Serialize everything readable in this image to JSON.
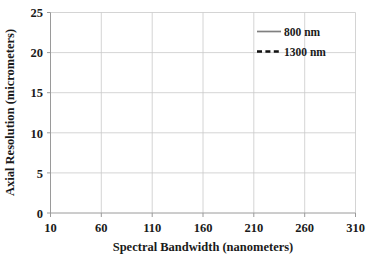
{
  "chart_data": {
    "type": "line",
    "title": "",
    "xlabel": "Spectral Bandwidth (nanometers)",
    "ylabel": "Axial Resolution (micrometers)",
    "xlim": [
      10,
      310
    ],
    "ylim": [
      0,
      25
    ],
    "xticks": [
      10,
      60,
      110,
      160,
      210,
      260,
      310
    ],
    "yticks": [
      0,
      5,
      10,
      15,
      20,
      25
    ],
    "grid": true,
    "legend_position": "top-right",
    "formula": "axial_resolution = (2*ln2/pi) * (lambda^2 / bandwidth)",
    "series": [
      {
        "name": "800 nm",
        "color": "#808080",
        "style": "solid",
        "center_wavelength_nm": 800,
        "x": [
          10,
          15,
          20,
          25,
          30,
          35,
          40,
          45,
          50,
          60,
          70,
          80,
          90,
          100,
          110,
          120,
          130,
          140,
          150,
          160,
          170,
          180,
          190,
          200,
          210,
          220,
          230,
          240,
          250,
          260,
          270,
          280,
          290,
          300,
          310
        ],
        "values": [
          28.23,
          18.82,
          14.12,
          11.29,
          9.41,
          8.07,
          7.06,
          6.27,
          5.65,
          4.71,
          4.03,
          3.53,
          3.14,
          2.82,
          2.57,
          2.35,
          2.17,
          2.02,
          1.88,
          1.76,
          1.66,
          1.57,
          1.49,
          1.41,
          1.34,
          1.28,
          1.23,
          1.18,
          1.13,
          1.09,
          1.05,
          1.01,
          0.97,
          0.94,
          0.91
        ]
      },
      {
        "name": "1300 nm",
        "color": "#111111",
        "style": "dashed",
        "center_wavelength_nm": 1300,
        "x": [
          10,
          15,
          20,
          25,
          30,
          35,
          40,
          45,
          50,
          60,
          70,
          80,
          90,
          100,
          110,
          120,
          130,
          140,
          150,
          160,
          170,
          180,
          190,
          200,
          210,
          220,
          230,
          240,
          250,
          260,
          270,
          280,
          290,
          300,
          310
        ],
        "values": [
          74.57,
          49.71,
          37.28,
          29.83,
          24.86,
          21.31,
          18.64,
          16.57,
          14.91,
          12.43,
          10.65,
          9.32,
          8.29,
          7.46,
          6.78,
          6.21,
          5.74,
          5.33,
          4.97,
          4.66,
          4.39,
          4.14,
          3.92,
          3.73,
          3.55,
          3.39,
          3.24,
          3.11,
          2.98,
          2.87,
          2.76,
          2.66,
          2.57,
          2.49,
          2.41
        ]
      }
    ],
    "legend": [
      {
        "label": "800 nm"
      },
      {
        "label": "1300 nm"
      }
    ]
  },
  "axis": {
    "x_title": "Spectral Bandwidth (nanometers)",
    "y_title": "Axial Resolution (micrometers)",
    "x_tick_labels": [
      "10",
      "60",
      "110",
      "160",
      "210",
      "260",
      "310"
    ],
    "y_tick_labels": [
      "25",
      "20",
      "15",
      "10",
      "5",
      "0"
    ]
  },
  "legend": {
    "entry_800_label": "800 nm",
    "entry_1300_label": "1300 nm"
  },
  "colors": {
    "series_800": "#808080",
    "series_1300": "#111111",
    "gridline": "#c9c9c9",
    "axis": "#9a9a9a",
    "text": "#1a1a1a",
    "background": "#ffffff"
  }
}
